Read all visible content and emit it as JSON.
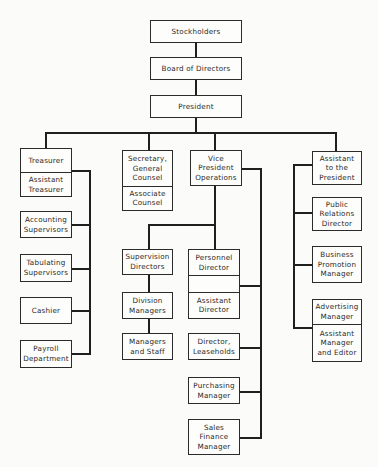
{
  "chart_title": "Organization Chart",
  "top_chain": [
    {
      "id": "stockholders",
      "label": "Stockholders"
    },
    {
      "id": "board",
      "label": "Board of Directors"
    },
    {
      "id": "president",
      "label": "President"
    }
  ],
  "branches": {
    "treasurer": {
      "head": [
        "Treasurer",
        "Assistant\nTreasurer"
      ],
      "subordinates": [
        "Accounting\nSupervisors",
        "Tabulating\nSupervisors",
        "Cashier",
        "Payroll\nDepartment"
      ]
    },
    "secretary": {
      "head": [
        "Secretary,\nGeneral\nCounsel",
        "Associate\nCounsel"
      ]
    },
    "vp_operations": {
      "head": [
        "Vice\nPresident\nOperations"
      ],
      "supervision_chain": [
        "Supervision\nDirectors",
        "Division\nManagers",
        "Managers\nand Staff"
      ],
      "personnel": [
        "Personnel\nDirector",
        "",
        "Assistant\nDirector"
      ],
      "subordinates": [
        "Director,\nLeaseholds",
        "Purchasing\nManager",
        "Sales\nFinance\nManager"
      ]
    },
    "assistant_to_president": {
      "head": [
        "Assistant\nto the\nPresident"
      ],
      "subordinates": [
        "Public\nRelations\nDirector",
        "Business\nPromotion\nManager"
      ],
      "advertising": [
        "Advertising\nManager",
        "Assistant\nManager\nand Editor"
      ]
    }
  }
}
